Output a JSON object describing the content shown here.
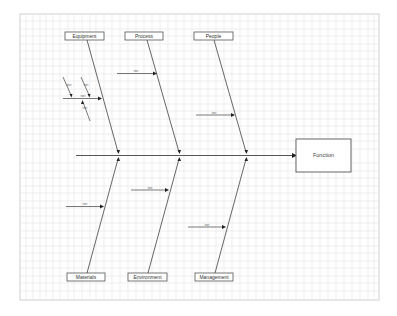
{
  "diagram": {
    "type": "fishbone",
    "effect": {
      "label": "Function"
    },
    "categories_top": [
      {
        "label": "Equipment"
      },
      {
        "label": "Process"
      },
      {
        "label": "People"
      }
    ],
    "categories_bottom": [
      {
        "label": "Materials"
      },
      {
        "label": "Environment"
      },
      {
        "label": "Management"
      }
    ],
    "causes": {
      "equipment": {
        "label": "text"
      },
      "equipment_sub_1": {
        "label": "text"
      },
      "equipment_sub_2": {
        "label": "text"
      },
      "equipment_sub_3": {
        "label": "text"
      },
      "equipment_sub_4": {
        "label": "text"
      },
      "process": {
        "label": "text"
      },
      "people": {
        "label": "text"
      },
      "materials": {
        "label": "text"
      },
      "environment": {
        "label": "text"
      },
      "management": {
        "label": "text"
      }
    },
    "colors": {
      "line": "#555555",
      "arrow": "#222222",
      "grid": "#e6e6e6",
      "frame": "#cfcfcf"
    }
  }
}
